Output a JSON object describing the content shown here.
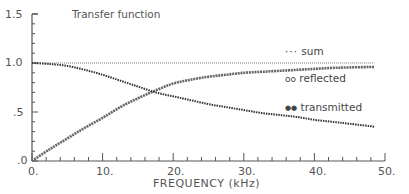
{
  "chart_data": {
    "type": "line",
    "title": "Transfer function",
    "xlabel": "FREQUENCY (kHz)",
    "ylabel": "",
    "xlim": [
      0,
      50
    ],
    "ylim": [
      0,
      1.5
    ],
    "x_ticks": [
      "0.",
      "10.",
      "20.",
      "30.",
      "40.",
      "50."
    ],
    "y_ticks": [
      ".0",
      ".5",
      "1.0",
      "1.5"
    ],
    "grid": false,
    "legend_position": "right, inside plot",
    "x": [
      0,
      2.5,
      5,
      7.5,
      10,
      12.5,
      15,
      17.5,
      20,
      22.5,
      25,
      27.5,
      30,
      32.5,
      35,
      37.5,
      40,
      42.5,
      45,
      48.5
    ],
    "series": [
      {
        "name": "sum",
        "marker": "small dots",
        "values": [
          1.0,
          1.0,
          1.0,
          1.0,
          1.0,
          1.0,
          1.0,
          1.0,
          1.0,
          1.0,
          1.0,
          1.0,
          1.0,
          1.0,
          1.0,
          1.0,
          1.0,
          1.0,
          1.0,
          1.0
        ]
      },
      {
        "name": "reflected",
        "marker": "open circles",
        "values": [
          0.0,
          0.12,
          0.23,
          0.34,
          0.44,
          0.55,
          0.64,
          0.72,
          0.79,
          0.83,
          0.86,
          0.88,
          0.9,
          0.91,
          0.92,
          0.93,
          0.94,
          0.95,
          0.955,
          0.96
        ]
      },
      {
        "name": "transmitted",
        "marker": "filled dots",
        "values": [
          1.0,
          0.99,
          0.97,
          0.93,
          0.88,
          0.82,
          0.76,
          0.7,
          0.66,
          0.62,
          0.58,
          0.55,
          0.52,
          0.49,
          0.47,
          0.45,
          0.42,
          0.4,
          0.38,
          0.35
        ]
      }
    ],
    "annotations": [
      {
        "text": "crossing of reflected and transmitted",
        "x": 16.7,
        "y": 0.72
      }
    ]
  },
  "labels": {
    "title": "Transfer function",
    "xlabel": "FREQUENCY (kHz)",
    "yticks": {
      "y15": "1.5",
      "y10": "1.0",
      "y05": ".5",
      "y00": ".0"
    },
    "xticks": {
      "x0": "0.",
      "x10": "10.",
      "x20": "20.",
      "x30": "30.",
      "x40": "40.",
      "x50": "50."
    },
    "legend": {
      "sum": "sum",
      "reflected": "reflected",
      "transmitted": "transmitted",
      "sum_symbol": "···",
      "reflected_symbol": "oo",
      "transmitted_symbol": "●●"
    }
  }
}
